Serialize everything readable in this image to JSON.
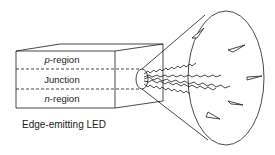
{
  "diagram": {
    "title": "Edge-emitting LED",
    "regions": [
      {
        "id": "p",
        "italic_prefix": "p",
        "suffix": "-region"
      },
      {
        "id": "junction",
        "italic_prefix": "",
        "suffix": "Junction"
      },
      {
        "id": "n",
        "italic_prefix": "n",
        "suffix": "-region"
      }
    ],
    "caption": "Edge-emitting LED",
    "colors": {
      "stroke": "#1a1a1a",
      "background": "#ffffff"
    }
  }
}
